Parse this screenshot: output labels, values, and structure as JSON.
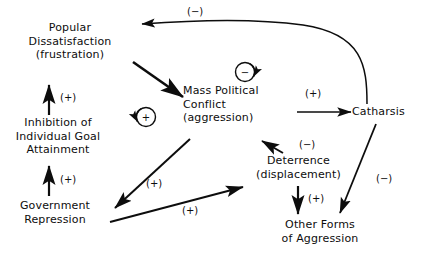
{
  "diagram": {
    "type": "causal-loop-diagram",
    "stroke_color": "#0d0d0d",
    "background_color": "#ffffff",
    "nodes": [
      {
        "id": "popular-dissatisfaction",
        "lines": [
          "Popular",
          "Dissatisfaction",
          "(frustration)"
        ]
      },
      {
        "id": "inhibition-of-individual-goal-attainment",
        "lines": [
          "Inhibition of",
          "Individual Goal",
          "Attainment"
        ]
      },
      {
        "id": "government-repression",
        "lines": [
          "Government",
          "Repression"
        ]
      },
      {
        "id": "mass-political-conflict",
        "lines": [
          "Mass Political",
          "Conflict",
          "(aggression)"
        ]
      },
      {
        "id": "catharsis",
        "lines": [
          "Catharsis"
        ]
      },
      {
        "id": "deterrence",
        "lines": [
          "Deterrence",
          "(displacement)"
        ]
      },
      {
        "id": "other-forms-of-aggression",
        "lines": [
          "Other Forms",
          "of Aggression"
        ]
      }
    ],
    "edge_signs": [
      {
        "id": "catharsis-to-popular-dissatisfaction",
        "sign": "(−)"
      },
      {
        "id": "inhibition-to-popular-dissatisfaction",
        "sign": "(+)"
      },
      {
        "id": "government-repression-to-inhibition",
        "sign": "(+)"
      },
      {
        "id": "mass-political-conflict-to-catharsis",
        "sign": "(+)"
      },
      {
        "id": "mass-political-conflict-to-government-repression",
        "sign": "(+)"
      },
      {
        "id": "deterrence-to-mass-political-conflict",
        "sign": "(−)"
      },
      {
        "id": "government-repression-to-deterrence",
        "sign": "(+)"
      },
      {
        "id": "deterrence-to-other-forms-of-aggression",
        "sign": "(+)"
      },
      {
        "id": "catharsis-to-other-forms-of-aggression",
        "sign": "(−)"
      }
    ],
    "loop_markers": [
      {
        "id": "reinforcing-loop-marker",
        "sign": "+",
        "polarity": "reinforcing"
      },
      {
        "id": "balancing-loop-marker",
        "sign": "−",
        "polarity": "balancing"
      }
    ]
  }
}
